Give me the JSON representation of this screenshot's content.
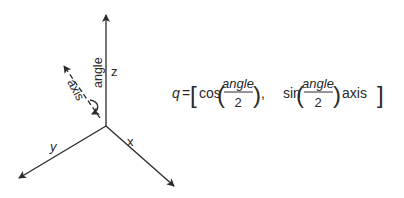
{
  "axes": {
    "z_label": "z",
    "x_label": "x",
    "y_label": "y",
    "rotation_axis_label": "axis",
    "angle_label": "angle"
  },
  "formula": {
    "lhs": "q",
    "equals": "=",
    "open_bracket": "[",
    "cos": "cos",
    "sin": "sin",
    "numerator_1": "angle",
    "denominator_1": "2",
    "numerator_2": "angle",
    "denominator_2": "2",
    "comma": ",",
    "axis": "axis",
    "close_bracket": "]"
  },
  "colors": {
    "stroke": "#2a2a2a",
    "background": "#ffffff"
  }
}
